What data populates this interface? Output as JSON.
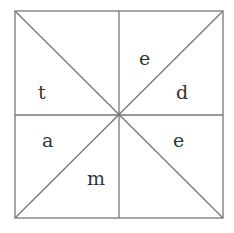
{
  "diagram": {
    "lineColor": "#777777",
    "letters": {
      "top_left": "t",
      "top_right_upper": "e",
      "top_right_lower": "d",
      "bottom_left_upper": "a",
      "bottom_left_lower": "m",
      "bottom_right": "e"
    }
  }
}
